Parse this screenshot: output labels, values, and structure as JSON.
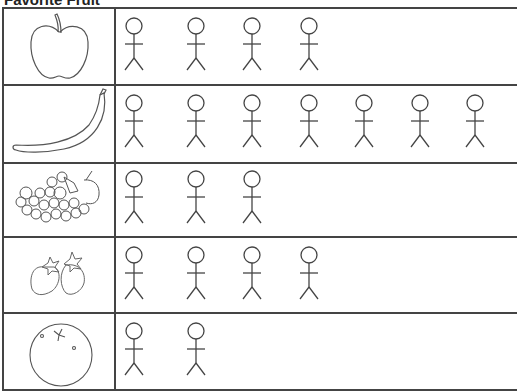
{
  "title": "Favorite Fruit",
  "chart_data": {
    "type": "pictograph",
    "title": "Favorite Fruit",
    "categories": [
      "Apple",
      "Banana",
      "Grapes",
      "Strawberry",
      "Orange"
    ],
    "values": [
      4,
      7,
      3,
      4,
      2
    ],
    "symbol": "stick-figure person",
    "xlabel": "",
    "ylabel": ""
  },
  "rows": [
    {
      "fruit": "apple",
      "count": 4
    },
    {
      "fruit": "banana",
      "count": 7
    },
    {
      "fruit": "grapes",
      "count": 3
    },
    {
      "fruit": "strawberry",
      "count": 4
    },
    {
      "fruit": "orange",
      "count": 2
    }
  ]
}
